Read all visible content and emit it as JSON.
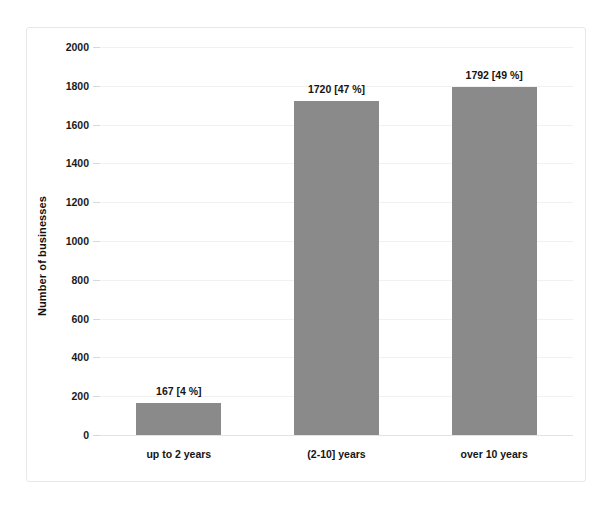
{
  "chart_data": {
    "type": "bar",
    "title": "",
    "subtitle": "",
    "xlabel": "",
    "ylabel": "Number of businesses",
    "categories": [
      "up to 2 years",
      "(2-10] years",
      "over 10 years"
    ],
    "values": [
      167,
      1720,
      1792
    ],
    "data_labels": [
      "167 [4 %]",
      "1720 [47 %]",
      "1792 [49 %]"
    ],
    "percentages": [
      4,
      47,
      49
    ],
    "ylim": [
      0,
      2000
    ],
    "ytick_labels": [
      "2000",
      "1800",
      "1600",
      "1400",
      "1200",
      "1000",
      "800",
      "600",
      "400",
      "200",
      "0"
    ],
    "ytick_values": [
      2000,
      1800,
      1600,
      1400,
      1200,
      1000,
      800,
      600,
      400,
      200,
      0
    ],
    "ytick_step": 200,
    "grid": true,
    "legend": false,
    "legend_position": "none",
    "bar_color": "#8a8a8a",
    "gridline_color": "#f1f1f1",
    "axis_color": "#e3e3e3",
    "text_color": "#141414",
    "background_color": "#ffffff",
    "border_color": "#e8e8e8"
  }
}
